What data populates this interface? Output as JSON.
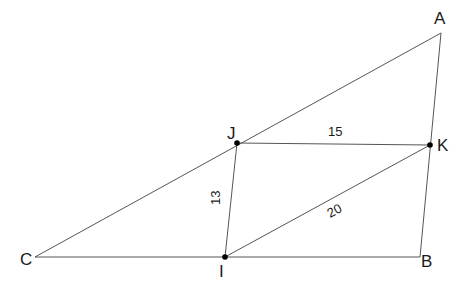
{
  "diagram": {
    "type": "geometry",
    "points": {
      "A": {
        "label": "A",
        "x": 441,
        "y": 33
      },
      "B": {
        "label": "B",
        "x": 420,
        "y": 257
      },
      "C": {
        "label": "C",
        "x": 35,
        "y": 257
      },
      "I": {
        "label": "I",
        "x": 225,
        "y": 257
      },
      "J": {
        "label": "J",
        "x": 237,
        "y": 143
      },
      "K": {
        "label": "K",
        "x": 430,
        "y": 145
      }
    },
    "segments": [
      {
        "from": "C",
        "to": "A"
      },
      {
        "from": "A",
        "to": "B"
      },
      {
        "from": "C",
        "to": "B"
      },
      {
        "from": "J",
        "to": "K"
      },
      {
        "from": "J",
        "to": "I"
      },
      {
        "from": "I",
        "to": "K"
      }
    ],
    "lengths": {
      "JK": "15",
      "JI": "13",
      "IK": "20"
    },
    "marked_points": [
      "J",
      "K",
      "I"
    ]
  }
}
